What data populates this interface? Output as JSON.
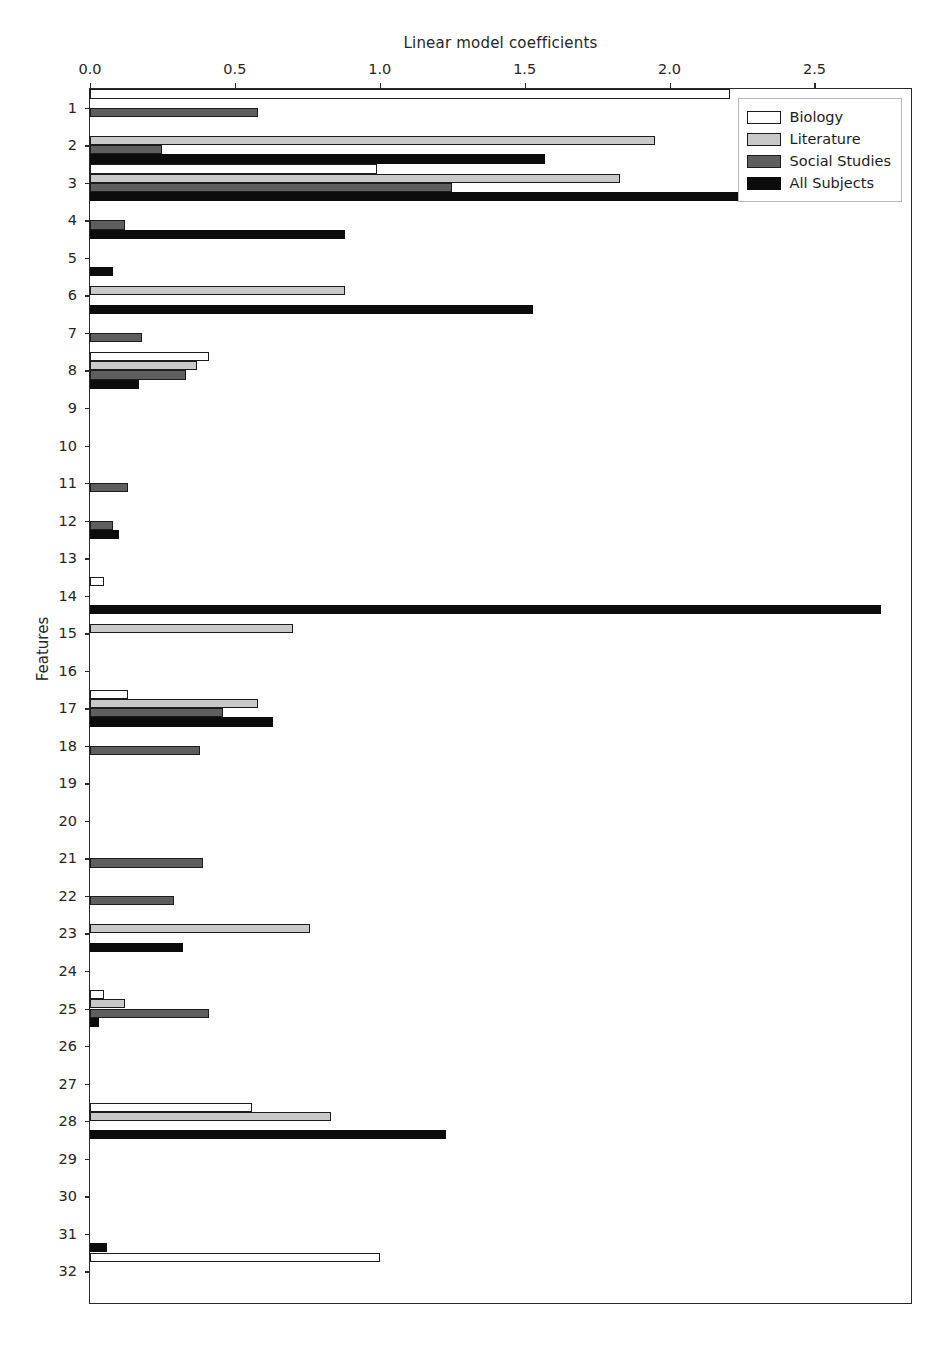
{
  "chart_data": {
    "type": "bar",
    "orientation": "horizontal",
    "title": "Linear model coefficients",
    "xlabel": "Linear model coefficients",
    "ylabel": "Features",
    "xlim": [
      0.0,
      2.84
    ],
    "xticks": [
      0.0,
      0.5,
      1.0,
      1.5,
      2.0,
      2.5
    ],
    "xtick_labels": [
      "0.0",
      "0.5",
      "1.0",
      "1.5",
      "2.0",
      "2.5"
    ],
    "grid": false,
    "legend_position": "upper right",
    "categories": [
      "1",
      "2",
      "3",
      "4",
      "5",
      "6",
      "7",
      "8",
      "9",
      "10",
      "11",
      "12",
      "13",
      "14",
      "15",
      "16",
      "17",
      "18",
      "19",
      "20",
      "21",
      "22",
      "23",
      "24",
      "25",
      "26",
      "27",
      "28",
      "29",
      "30",
      "31",
      "32"
    ],
    "series": [
      {
        "name": "Biology",
        "color": "#ffffff",
        "values": [
          2.21,
          0.0,
          0.99,
          0.0,
          0.0,
          0.0,
          0.0,
          0.41,
          0.0,
          0.0,
          0.0,
          0.0,
          0.0,
          0.05,
          0.0,
          0.0,
          0.13,
          0.0,
          0.0,
          0.0,
          0.0,
          0.0,
          0.0,
          0.0,
          0.05,
          0.0,
          0.0,
          0.56,
          0.0,
          0.0,
          0.0,
          1.0
        ]
      },
      {
        "name": "Literature",
        "color": "#c9c9c9",
        "values": [
          0.0,
          1.95,
          1.83,
          0.0,
          0.0,
          0.88,
          0.0,
          0.37,
          0.0,
          0.0,
          0.0,
          0.0,
          0.0,
          0.0,
          0.7,
          0.0,
          0.58,
          0.0,
          0.0,
          0.0,
          0.0,
          0.0,
          0.76,
          0.0,
          0.12,
          0.0,
          0.0,
          0.83,
          0.0,
          0.0,
          0.0,
          0.0
        ]
      },
      {
        "name": "Social Studies",
        "color": "#5e5e5e",
        "values": [
          0.58,
          0.25,
          1.25,
          0.12,
          0.0,
          0.0,
          0.18,
          0.33,
          0.0,
          0.0,
          0.13,
          0.08,
          0.0,
          0.0,
          0.0,
          0.0,
          0.46,
          0.38,
          0.0,
          0.0,
          0.39,
          0.29,
          0.0,
          0.0,
          0.41,
          0.0,
          0.0,
          0.0,
          0.0,
          0.0,
          0.0,
          0.0
        ]
      },
      {
        "name": "All Subjects",
        "color": "#0c0c0c",
        "values": [
          0.0,
          1.57,
          2.35,
          0.88,
          0.08,
          1.53,
          0.0,
          0.17,
          0.0,
          0.0,
          0.0,
          0.1,
          0.0,
          2.73,
          0.0,
          0.0,
          0.63,
          0.0,
          0.0,
          0.0,
          0.0,
          0.0,
          0.32,
          0.0,
          0.03,
          0.0,
          0.0,
          1.23,
          0.0,
          0.0,
          0.06,
          0.0
        ]
      }
    ]
  },
  "legend": {
    "items": [
      {
        "label": "Biology",
        "key": "biology"
      },
      {
        "label": "Literature",
        "key": "literature"
      },
      {
        "label": "Social Studies",
        "key": "social"
      },
      {
        "label": "All Subjects",
        "key": "all"
      }
    ]
  },
  "axes": {
    "title_text": "Linear model coefficients",
    "ylabel_text": "Features"
  }
}
